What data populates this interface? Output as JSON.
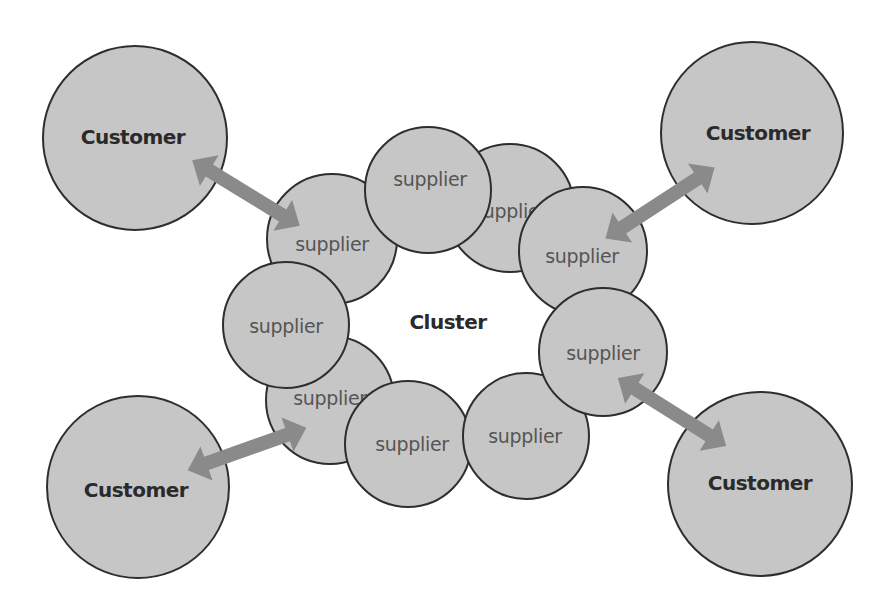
{
  "diagram": {
    "center_label": "Cluster",
    "colors": {
      "circle_fill": "#c6c6c6",
      "circle_stroke": "#2e2e2e",
      "arrow": "#8a8a8a",
      "customer_text": "#2a2a2a",
      "supplier_text": "#555555",
      "background": "#ffffff"
    },
    "customers": [
      {
        "label": "Customer",
        "position": "top-left"
      },
      {
        "label": "Customer",
        "position": "top-right"
      },
      {
        "label": "Customer",
        "position": "bottom-left"
      },
      {
        "label": "Customer",
        "position": "bottom-right"
      }
    ],
    "suppliers": [
      {
        "label": "supplier"
      },
      {
        "label": "supplier"
      },
      {
        "label": "supplier"
      },
      {
        "label": "supplier"
      },
      {
        "label": "supplier"
      },
      {
        "label": "supplier"
      },
      {
        "label": "supplier"
      },
      {
        "label": "supplier"
      },
      {
        "label": "supplier"
      }
    ],
    "connections": [
      {
        "from": "Customer (top-left)",
        "to": "supplier",
        "type": "bidirectional-arrow"
      },
      {
        "from": "Customer (top-right)",
        "to": "supplier",
        "type": "bidirectional-arrow"
      },
      {
        "from": "Customer (bottom-left)",
        "to": "supplier",
        "type": "bidirectional-arrow"
      },
      {
        "from": "Customer (bottom-right)",
        "to": "supplier",
        "type": "bidirectional-arrow"
      }
    ]
  }
}
